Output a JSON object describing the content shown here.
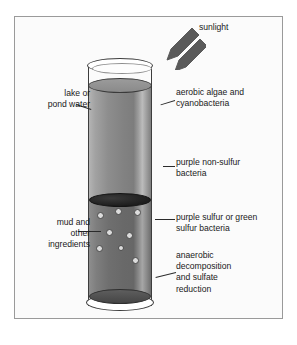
{
  "figure": {
    "background_color": "#ffffff",
    "frame_color": "#9a9a9a"
  },
  "labels": {
    "sunlight": "sunlight",
    "lake_or_pond_water": "lake or\npond water",
    "mud_and_other_ingredients": "mud and\nother\ningredients",
    "aerobic_algae_and_cyanobacteria": "aerobic algae and\ncyanobacteria",
    "purple_non_sulfur_bacteria": "purple non-sulfur\nbacteria",
    "purple_sulfur_or_green_sulfur_bacteria": "purple sulfur or green\nsulfur bacteria",
    "anaerobic_decomposition_and_sulfate_reduction": "anaerobic\ndecomposition\nand sulfate\nreduction"
  },
  "diagram": {
    "vessel": "cylinder",
    "layers": [
      {
        "name": "air-headspace",
        "fill": "#ffffff"
      },
      {
        "name": "water-column",
        "fill": "#858585"
      },
      {
        "name": "mud-layer",
        "fill": "#6d6d6d"
      }
    ],
    "bubbles": [
      {
        "x": 11,
        "y": 156,
        "d": 7
      },
      {
        "x": 29,
        "y": 152,
        "d": 7
      },
      {
        "x": 48,
        "y": 153,
        "d": 7
      },
      {
        "x": 20,
        "y": 173,
        "d": 7
      },
      {
        "x": 40,
        "y": 176,
        "d": 7
      },
      {
        "x": 10,
        "y": 189,
        "d": 7
      },
      {
        "x": 32,
        "y": 189,
        "d": 6
      },
      {
        "x": 46,
        "y": 201,
        "d": 7
      }
    ],
    "sunlight_arrow_count": 2,
    "sunlight_arrow_direction": "down-left",
    "sunlight_arrow_color": "#5a5a5a"
  }
}
